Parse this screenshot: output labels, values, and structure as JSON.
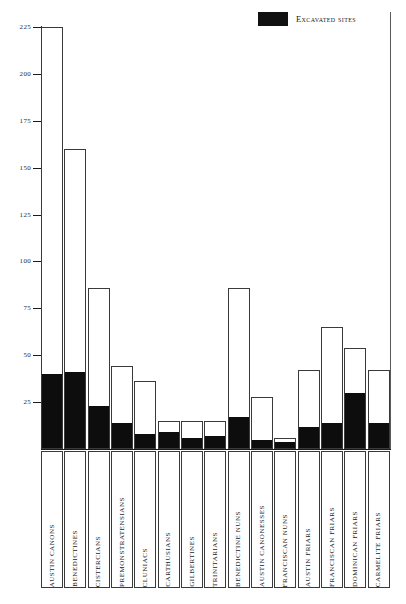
{
  "legend": {
    "swatch_color": "#111111",
    "label": "Excavated sites"
  },
  "axis": {
    "ylabel": "",
    "xlabel": "",
    "ticks": [
      225,
      200,
      175,
      150,
      125,
      100,
      75,
      50,
      25
    ],
    "ymin": 0,
    "ymax": 225
  },
  "chart_data": {
    "type": "bar",
    "title": "",
    "subtitle": "",
    "xlabel": "",
    "ylabel": "",
    "ylim": [
      0,
      225
    ],
    "grid": false,
    "legend_position": "top-right",
    "stacked": true,
    "categories": [
      "AUSTIN CANONS",
      "BENEDICTINES",
      "CISTERCIANS",
      "PREMONSTRATENSIANS",
      "CLUNIACS",
      "CARTHUSIANS",
      "GILBERTINES",
      "TRINITARIANS",
      "BENEDICTINE NUNS",
      "AUSTIN CANONESSES",
      "FRANCISCAN NUNS",
      "AUSTIN FRIARS",
      "FRANCISCAN FRIARS",
      "DOMINICAN FRIARS",
      "CARMELITE FRIARS"
    ],
    "series": [
      {
        "name": "Total sites",
        "color": "#ffffff",
        "values": [
          225,
          160,
          86,
          44,
          36,
          15,
          15,
          15,
          86,
          28,
          6,
          42,
          65,
          54,
          42
        ]
      },
      {
        "name": "Excavated sites",
        "color": "#111111",
        "values": [
          40,
          41,
          23,
          14,
          8,
          9,
          6,
          7,
          17,
          5,
          4,
          12,
          14,
          30,
          14
        ]
      }
    ],
    "annotations": []
  }
}
